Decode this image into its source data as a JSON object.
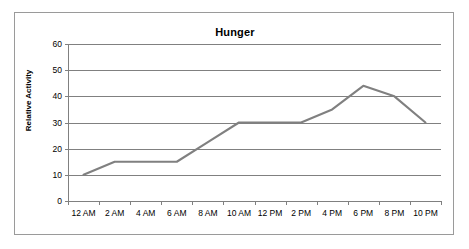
{
  "chart_data": {
    "type": "line",
    "title": "Hunger",
    "xlabel": "",
    "ylabel": "Relative Activity",
    "categories": [
      "12 AM",
      "2 AM",
      "4 AM",
      "6 AM",
      "8 AM",
      "10 AM",
      "12 PM",
      "2 PM",
      "4 PM",
      "6 PM",
      "8 PM",
      "10 PM"
    ],
    "values": [
      10,
      15,
      15,
      15,
      22.5,
      30,
      30,
      30,
      35,
      44,
      40,
      30
    ],
    "series": [
      {
        "name": "Hunger",
        "values": [
          10,
          15,
          15,
          15,
          22.5,
          30,
          30,
          30,
          35,
          44,
          40,
          30
        ],
        "color": "#808080"
      }
    ],
    "ylim": [
      0,
      60
    ],
    "ytick_labels": [
      "0",
      "10",
      "20",
      "30",
      "40",
      "50",
      "60"
    ],
    "ytick_values": [
      0,
      10,
      20,
      30,
      40,
      50,
      60
    ],
    "grid": "horizontal",
    "legend": "none",
    "markers": "none",
    "line_color": "#808080",
    "gridline_color": "#808080",
    "axis_color": "#808080",
    "border_color": "#9a9a9a",
    "background": "#ffffff"
  }
}
